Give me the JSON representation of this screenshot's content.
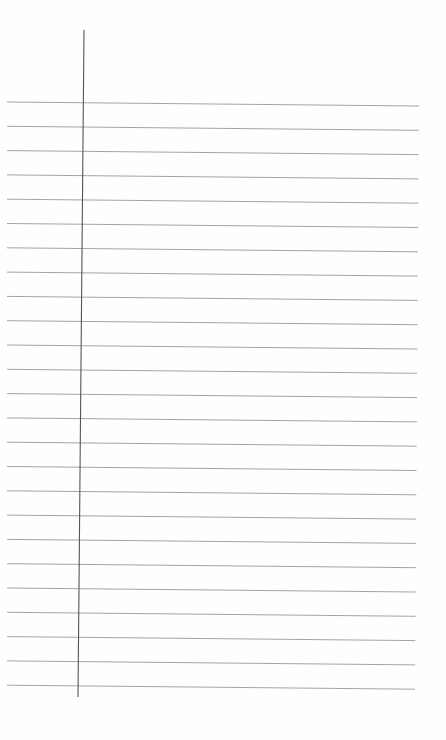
{
  "page": {
    "type": "lined-notebook-paper",
    "background": "#fefefe",
    "line_color": "#9a9a9a",
    "margin_color": "#555555",
    "line_count": 25,
    "lines": {
      "left_x": 7,
      "right_x_top": 419,
      "right_x_bottom": 415,
      "first_left_y": 102,
      "first_right_y": 106,
      "spacing": 24.3
    },
    "margin_line": {
      "x_top": 84,
      "y_top": 30,
      "x_bottom": 78,
      "y_bottom": 697
    }
  }
}
